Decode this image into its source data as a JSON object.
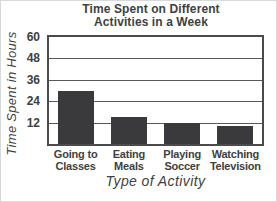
{
  "page": {
    "background": "#ffffff",
    "edge_border_color": "#d7dadb"
  },
  "chart_data": {
    "type": "bar",
    "title": "Time Spent on Different\nActivities in a Week",
    "xlabel": "Type of Activity",
    "ylabel": "Time Spent in Hours",
    "categories": [
      "Going to\nClasses",
      "Eating\nMeals",
      "Playing\nSoccer",
      "Watching\nTelevision"
    ],
    "values": [
      30,
      15,
      12,
      10
    ],
    "yticks": [
      12,
      24,
      36,
      48,
      60
    ],
    "ylim": [
      0,
      60
    ],
    "grid": true,
    "legend": "none",
    "bar_color": "#3a393b",
    "text_color": "#403f41",
    "grid_color": "#59585a",
    "plot_border_color": "#4b4a4c"
  }
}
